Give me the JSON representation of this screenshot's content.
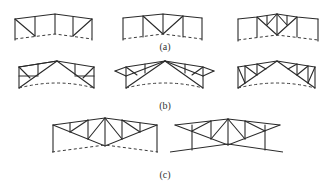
{
  "figure": {
    "rows": [
      {
        "label": "(a)",
        "description": "Portal frames with trussed rafters, dashed base line",
        "frames": [
          "frame-a1",
          "frame-a2",
          "frame-a3"
        ]
      },
      {
        "label": "(b)",
        "description": "Triangular trusses on columns with overhanging ends",
        "frames": [
          "frame-b1",
          "frame-b2",
          "frame-b3"
        ]
      },
      {
        "label": "(c)",
        "description": "Trapezoidal trusses supported on columns",
        "frames": [
          "frame-c1",
          "frame-c2"
        ]
      }
    ],
    "colors": {
      "line": "#2a2a2a",
      "background": "#ffffff"
    }
  }
}
